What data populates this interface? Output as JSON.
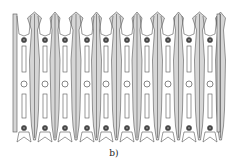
{
  "figure": {
    "caption": "b)",
    "columns": [
      24,
      45,
      65,
      87,
      106,
      127,
      147,
      168,
      189,
      210
    ],
    "column_count": 10,
    "top_dot_y": 40,
    "bottom_dot_y": 128,
    "center_circle_y": 84,
    "colors": {
      "stroke": "#555555",
      "fill_gray": "#d6d6d6",
      "background": "#ffffff"
    }
  }
}
